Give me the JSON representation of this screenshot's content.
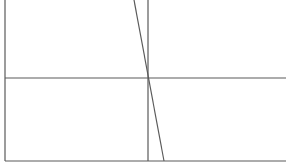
{
  "diagram": {
    "width": 286,
    "height": 166,
    "background": "#ffffff",
    "stroke_color": "#5a5a5a",
    "lines": [
      {
        "name": "left-axis-line",
        "x1": 5,
        "y1": 0,
        "x2": 5,
        "y2": 161
      },
      {
        "name": "bottom-axis-line",
        "x1": 5,
        "y1": 161,
        "x2": 286,
        "y2": 161
      },
      {
        "name": "vertical-reference-line",
        "x1": 148,
        "y1": 0,
        "x2": 148,
        "y2": 161
      },
      {
        "name": "horizontal-reference-line",
        "x1": 5,
        "y1": 78,
        "x2": 286,
        "y2": 78
      },
      {
        "name": "sloped-line",
        "x1": 134,
        "y1": 0,
        "x2": 164,
        "y2": 161
      }
    ],
    "intersection": {
      "x": 148,
      "y": 78
    }
  }
}
